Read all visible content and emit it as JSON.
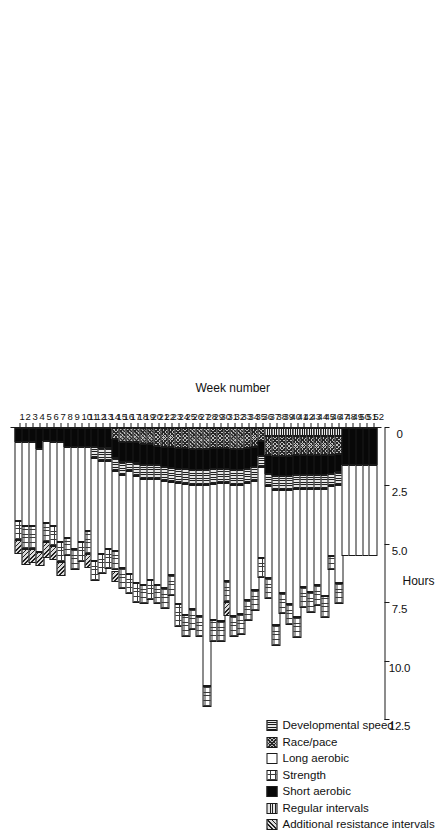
{
  "chart_data": {
    "type": "bar",
    "orientation": "horizontal-rotated",
    "title": "",
    "xlabel": "Week number",
    "ylabel": "Hours",
    "ylim": [
      0,
      13.2
    ],
    "ytick_labels": [
      "12.5",
      "10.0",
      "7.5",
      "5.0",
      "2.5",
      "0"
    ],
    "ytick_values": [
      12.5,
      10.0,
      7.5,
      5.0,
      2.5,
      0
    ],
    "grid": false,
    "legend_position": "upper-left",
    "categories": [
      "1",
      "2",
      "3",
      "4",
      "5",
      "6",
      "7",
      "8",
      "9",
      "10",
      "11",
      "12",
      "13",
      "14",
      "15",
      "16",
      "17",
      "18",
      "19",
      "20",
      "21",
      "22",
      "23",
      "24",
      "25",
      "26",
      "27",
      "28",
      "29",
      "30",
      "31",
      "32",
      "33",
      "34",
      "35",
      "36",
      "37",
      "38",
      "39",
      "40",
      "41",
      "42",
      "43",
      "44",
      "45",
      "46",
      "47",
      "48",
      "49",
      "50",
      "51",
      "52"
    ],
    "series": [
      {
        "name": "Developmental speed",
        "key": "dev",
        "pattern": "horizontal-lines",
        "values": [
          0,
          0,
          0,
          0,
          0,
          0,
          0,
          0,
          0,
          0,
          0,
          0,
          0,
          0,
          0,
          0,
          0,
          0,
          0,
          0,
          0,
          0,
          0,
          0,
          0,
          0,
          0,
          0,
          0,
          0,
          0,
          0,
          0,
          0,
          0,
          0,
          0.35,
          0.35,
          0.35,
          0.35,
          0.35,
          0.35,
          0.35,
          0.35,
          0.35,
          0.35,
          0.35,
          0,
          0,
          0,
          0,
          0
        ]
      },
      {
        "name": "Race/pace",
        "key": "race",
        "pattern": "crosshatch",
        "values": [
          0,
          0,
          0,
          0,
          0,
          0,
          0,
          0,
          0,
          0,
          0,
          0,
          0,
          0,
          0.45,
          0.6,
          0.6,
          0.6,
          0.7,
          0.7,
          0.75,
          0.8,
          0.8,
          0.85,
          0.85,
          0.9,
          0.9,
          0.9,
          0.85,
          0.85,
          0.85,
          0.9,
          0.9,
          0.85,
          0.8,
          0.55,
          0.8,
          0.85,
          0.85,
          0.85,
          0.8,
          0.8,
          0.8,
          0.8,
          0.8,
          0.8,
          0.75,
          0,
          0,
          0,
          0,
          0
        ]
      },
      {
        "name": "Long aerobic",
        "key": "long",
        "pattern": "white",
        "values": [
          3.4,
          3.6,
          3.6,
          4.4,
          3.5,
          3.6,
          4.3,
          3.9,
          4.4,
          4.1,
          3.6,
          4.4,
          4.0,
          3.8,
          3.4,
          4.0,
          4.4,
          4.6,
          4.5,
          4.3,
          4.5,
          4.6,
          4.0,
          5.2,
          5.6,
          5.3,
          5.6,
          8.6,
          5.8,
          5.9,
          4.2,
          5.6,
          5.5,
          5.0,
          4.7,
          3.9,
          3.9,
          5.8,
          4.4,
          4.9,
          5.5,
          4.2,
          4.4,
          4.1,
          4.6,
          3.0,
          4.2,
          3.9,
          3.9,
          3.9,
          3.9,
          3.9
        ]
      },
      {
        "name": "Strength",
        "key": "strength",
        "pattern": "fine-dots",
        "values": [
          0.8,
          1.0,
          1.0,
          0,
          0.85,
          0.85,
          0.85,
          0.8,
          0.9,
          0.85,
          1.0,
          0.85,
          0.85,
          0.85,
          0.85,
          0.9,
          0.85,
          0.85,
          0.85,
          0.85,
          0.85,
          0.9,
          0.9,
          0.95,
          0.95,
          0.9,
          0.9,
          0.9,
          0.95,
          0.9,
          0.9,
          0.9,
          0.9,
          0.9,
          0.9,
          0.85,
          0.9,
          0.9,
          0.9,
          0.9,
          0.9,
          0.9,
          0.9,
          0.9,
          0.95,
          0.6,
          0.9,
          0,
          0,
          0,
          0,
          0
        ]
      },
      {
        "name": "Short aerobic",
        "key": "short",
        "pattern": "solid-black",
        "values": [
          0.6,
          0.6,
          0.6,
          0.9,
          0.55,
          0.6,
          0.6,
          0.8,
          0.8,
          0.8,
          0.8,
          0.8,
          0.85,
          0.85,
          0.85,
          0.85,
          0.85,
          0.9,
          0.9,
          0.9,
          0.85,
          0.85,
          0.9,
          0.9,
          0.9,
          0.9,
          0.9,
          0.9,
          0.9,
          0.9,
          0.9,
          0.9,
          0.9,
          0.9,
          0.85,
          0.65,
          0.8,
          0.85,
          0.85,
          0.85,
          0.85,
          0.85,
          0.85,
          0.85,
          0.85,
          0.8,
          0.8,
          1.6,
          1.6,
          1.6,
          1.6,
          1.6
        ]
      },
      {
        "name": "Regular intervals",
        "key": "reg",
        "pattern": "vertical-lines",
        "values": [
          0,
          0,
          0,
          0,
          0,
          0,
          0,
          0,
          0,
          0,
          0,
          0.5,
          0.55,
          0.55,
          0.55,
          0.55,
          0.4,
          0.55,
          0.6,
          0.6,
          0.6,
          0.6,
          0.6,
          0.6,
          0.65,
          0.65,
          0.65,
          0.65,
          0.65,
          0.6,
          0.6,
          0.65,
          0.65,
          0.6,
          0.6,
          0.45,
          0.55,
          0.6,
          0.6,
          0.6,
          0.6,
          0.6,
          0.6,
          0.6,
          0.6,
          0.55,
          0.55,
          0,
          0,
          0,
          0,
          0
        ]
      },
      {
        "name": "Additional resistance intervals",
        "key": "add",
        "pattern": "diagonal-hatch",
        "values": [
          0.6,
          0.65,
          0.6,
          0.6,
          0.65,
          0.6,
          0.6,
          0,
          0,
          0,
          0.6,
          0,
          0,
          0,
          0.5,
          0,
          0,
          0,
          0,
          0,
          0,
          0,
          0,
          0,
          0,
          0,
          0,
          0,
          0,
          0,
          0.6,
          0,
          0,
          0,
          0,
          0,
          0,
          0,
          0,
          0,
          0,
          0,
          0,
          0,
          0,
          0,
          0,
          0,
          0,
          0,
          0,
          0
        ]
      }
    ]
  },
  "legend": {
    "items": [
      {
        "label": "Developmental speed",
        "swatch": "horizontal-lines-swatch"
      },
      {
        "label": "Race/pace",
        "swatch": "crosshatch-swatch"
      },
      {
        "label": "Long aerobic",
        "swatch": "white-swatch"
      },
      {
        "label": "Strength",
        "swatch": "fine-dots-swatch"
      },
      {
        "label": "Short aerobic",
        "swatch": "solid-black-swatch"
      },
      {
        "label": "Regular intervals",
        "swatch": "vertical-lines-swatch"
      },
      {
        "label": "Additional resistance intervals",
        "swatch": "diagonal-hatch-swatch"
      }
    ]
  },
  "colors": {
    "axis": "#1a1a1a",
    "text": "#111111",
    "background": "#ffffff"
  }
}
